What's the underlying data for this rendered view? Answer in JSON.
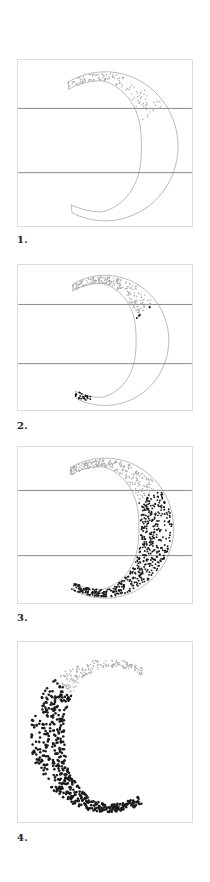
{
  "figures": [
    {
      "label": "1.",
      "top": 59,
      "height": 168,
      "label_top": 234,
      "mirrored": true,
      "guides": [
        49,
        114
      ],
      "stage": 1
    },
    {
      "label": "2.",
      "top": 264,
      "height": 147,
      "label_top": 420,
      "mirrored": true,
      "guides": [
        40,
        100
      ],
      "stage": 2
    },
    {
      "label": "3.",
      "top": 446,
      "height": 158,
      "label_top": 612,
      "mirrored": true,
      "guides": [
        44,
        110
      ],
      "stage": 3
    },
    {
      "label": "4.",
      "top": 641,
      "height": 182,
      "label_top": 832,
      "mirrored": false,
      "guides": [],
      "stage": 4
    }
  ],
  "colors": {
    "frame_border": "#dcdcdc",
    "guide_line": "#555555",
    "outline": "#8a8a8a",
    "light_dot": "#a8a8a8",
    "dark_dot": "#1a1a1a",
    "label": "#222222"
  }
}
